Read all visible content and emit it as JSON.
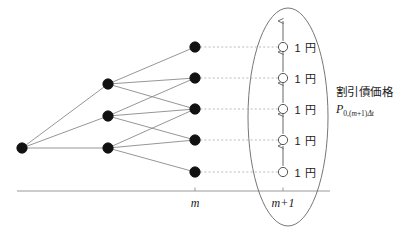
{
  "figure": {
    "background_color": "#ffffff",
    "width": 407,
    "height": 242
  },
  "colors": {
    "node_fill": "#111111",
    "node_stroke": "#111111",
    "terminal_fill": "#ffffff",
    "terminal_stroke": "#555555",
    "edge": "#8a8a8a",
    "dashed_connector": "#aaaaaa",
    "axis": "#999999",
    "ellipse": "#777777",
    "arrow": "#555555",
    "text": "#1a1a1a"
  },
  "axis": {
    "y": 191,
    "x_start": 17,
    "x_end": 330,
    "ticks": [
      {
        "name": "m",
        "label": "m",
        "x": 195
      },
      {
        "name": "m-plus-1",
        "label": "m+1",
        "x": 283
      }
    ]
  },
  "lattice": {
    "columns": [
      {
        "name": "root-column",
        "x": 22,
        "nodes": [
          {
            "id": "r0",
            "y": 148
          }
        ]
      },
      {
        "name": "intermediate-column",
        "x": 108,
        "nodes": [
          {
            "id": "a0",
            "y": 84
          },
          {
            "id": "a1",
            "y": 116
          },
          {
            "id": "a2",
            "y": 148
          }
        ]
      },
      {
        "name": "m-column",
        "x": 195,
        "nodes": [
          {
            "id": "b0",
            "y": 47
          },
          {
            "id": "b1",
            "y": 78
          },
          {
            "id": "b2",
            "y": 109
          },
          {
            "id": "b3",
            "y": 140
          },
          {
            "id": "b4",
            "y": 172
          }
        ]
      }
    ],
    "edges": [
      {
        "from": "r0",
        "to": "a0"
      },
      {
        "from": "r0",
        "to": "a1"
      },
      {
        "from": "r0",
        "to": "a2"
      },
      {
        "from": "a0",
        "to": "b0"
      },
      {
        "from": "a0",
        "to": "b1"
      },
      {
        "from": "a0",
        "to": "b2"
      },
      {
        "from": "a1",
        "to": "b1"
      },
      {
        "from": "a1",
        "to": "b2"
      },
      {
        "from": "a1",
        "to": "b3"
      },
      {
        "from": "a2",
        "to": "b2"
      },
      {
        "from": "a2",
        "to": "b3"
      },
      {
        "from": "a2",
        "to": "b4"
      }
    ],
    "node_radius": 5.2
  },
  "terminal": {
    "x": 283,
    "radius": 4.6,
    "payoff_label": "1 円",
    "nodes": [
      {
        "id": "t0",
        "y": 47,
        "label": "1 円"
      },
      {
        "id": "t1",
        "y": 78,
        "label": "1 円"
      },
      {
        "id": "t2",
        "y": 109,
        "label": "1 円"
      },
      {
        "id": "t3",
        "y": 140,
        "label": "1 円"
      },
      {
        "id": "t4",
        "y": 172,
        "label": "1 円"
      }
    ]
  },
  "ellipse": {
    "name": "terminal-group-ellipse",
    "cx": 288,
    "cy": 117,
    "rx": 40,
    "ry": 109
  },
  "annotation": {
    "caption": "割引債価格",
    "formula_base": "P",
    "formula_sub_prefix": "0,(",
    "formula_sub_var": "m",
    "formula_sub_mid": "+1)",
    "formula_sub_delta": "Δt",
    "x": 336,
    "y": 83
  }
}
